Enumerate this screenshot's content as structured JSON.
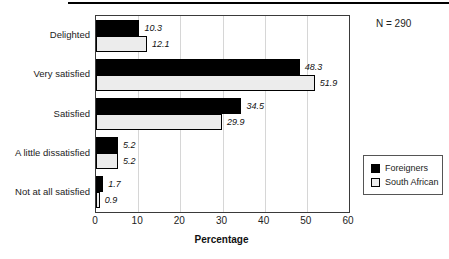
{
  "page": {
    "background": "#ffffff"
  },
  "annotations": {
    "n_label": "N = 290"
  },
  "chart_data": {
    "type": "bar",
    "orientation": "horizontal",
    "title": "",
    "categories": [
      "Delighted",
      "Very satisfied",
      "Satisfied",
      "A little dissatisfied",
      "Not at all satisfied"
    ],
    "series": [
      {
        "name": "Foreigners",
        "color": "#000000",
        "values": [
          10.3,
          48.3,
          34.5,
          5.2,
          1.7
        ]
      },
      {
        "name": "South African",
        "color": "#ececec",
        "values": [
          12.1,
          51.9,
          29.9,
          5.2,
          0.9
        ]
      }
    ],
    "value_labels": [
      "10.3",
      "12.1",
      "48.3",
      "51.9",
      "34.5",
      "29.9",
      "5.2",
      "5.2",
      "1.7",
      "0.9"
    ],
    "xlabel": "Percentage",
    "xlim": [
      0,
      60
    ],
    "xticks": [
      0,
      10,
      20,
      30,
      40,
      50,
      60
    ],
    "grid": true,
    "legend_position": "right-bottom",
    "annotation": "N = 290"
  },
  "colors": {
    "grid": "#d6d6d6",
    "frame": "#3a3a3a",
    "bar_border": "#000000",
    "text": "#1a1a1a"
  }
}
